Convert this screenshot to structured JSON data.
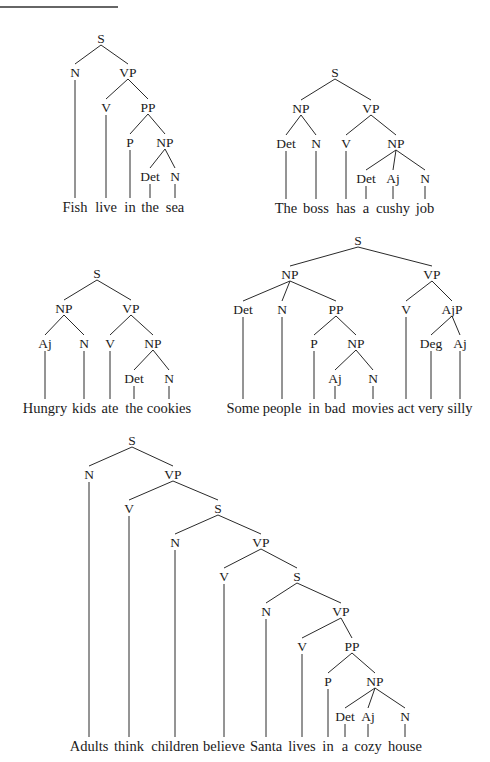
{
  "figure": {
    "top_rule": {
      "x1": 0,
      "x2": 118,
      "y": 7
    }
  },
  "trees": [
    {
      "id": "tree-fish",
      "sentence": "Fish live in the sea",
      "nodes": [
        {
          "id": "S",
          "label": "S",
          "x": 101,
          "y": 38
        },
        {
          "id": "N1",
          "label": "N",
          "x": 75,
          "y": 72,
          "parent": "S"
        },
        {
          "id": "VP",
          "label": "VP",
          "x": 128,
          "y": 72,
          "parent": "S"
        },
        {
          "id": "V",
          "label": "V",
          "x": 106,
          "y": 107,
          "parent": "VP"
        },
        {
          "id": "PP",
          "label": "PP",
          "x": 148,
          "y": 107,
          "parent": "VP"
        },
        {
          "id": "P",
          "label": "P",
          "x": 130,
          "y": 142,
          "parent": "PP"
        },
        {
          "id": "NP",
          "label": "NP",
          "x": 165,
          "y": 142,
          "parent": "PP"
        },
        {
          "id": "Det",
          "label": "Det",
          "x": 150,
          "y": 176,
          "parent": "NP"
        },
        {
          "id": "N2",
          "label": "N",
          "x": 175,
          "y": 176,
          "parent": "NP"
        }
      ],
      "words": [
        {
          "text": "Fish",
          "x": 75,
          "parent": "N1"
        },
        {
          "text": "live",
          "x": 106,
          "parent": "V"
        },
        {
          "text": "in",
          "x": 130,
          "parent": "P"
        },
        {
          "text": "the",
          "x": 150,
          "parent": "Det"
        },
        {
          "text": "sea",
          "x": 175,
          "parent": "N2"
        }
      ],
      "word_y": 212
    },
    {
      "id": "tree-boss",
      "sentence": "The boss has a cushy job",
      "nodes": [
        {
          "id": "S",
          "label": "S",
          "x": 335,
          "y": 72
        },
        {
          "id": "NP1",
          "label": "NP",
          "x": 301,
          "y": 108,
          "parent": "S"
        },
        {
          "id": "VP",
          "label": "VP",
          "x": 371,
          "y": 108,
          "parent": "S"
        },
        {
          "id": "Det1",
          "label": "Det",
          "x": 286,
          "y": 143,
          "parent": "NP1"
        },
        {
          "id": "N1",
          "label": "N",
          "x": 316,
          "y": 143,
          "parent": "NP1"
        },
        {
          "id": "V",
          "label": "V",
          "x": 346,
          "y": 143,
          "parent": "VP"
        },
        {
          "id": "NP2",
          "label": "NP",
          "x": 396,
          "y": 143,
          "parent": "VP"
        },
        {
          "id": "Det2",
          "label": "Det",
          "x": 366,
          "y": 178,
          "parent": "NP2"
        },
        {
          "id": "Aj",
          "label": "Aj",
          "x": 393,
          "y": 178,
          "parent": "NP2"
        },
        {
          "id": "N2",
          "label": "N",
          "x": 425,
          "y": 178,
          "parent": "NP2"
        }
      ],
      "words": [
        {
          "text": "The",
          "x": 286,
          "parent": "Det1"
        },
        {
          "text": "boss",
          "x": 316,
          "parent": "N1"
        },
        {
          "text": "has",
          "x": 346,
          "parent": "V"
        },
        {
          "text": "a",
          "x": 366,
          "parent": "Det2"
        },
        {
          "text": "cushy",
          "x": 393,
          "parent": "Aj"
        },
        {
          "text": "job",
          "x": 425,
          "parent": "N2"
        }
      ],
      "word_y": 213
    },
    {
      "id": "tree-hungry",
      "sentence": "Hungry kids ate the cookies",
      "nodes": [
        {
          "id": "S",
          "label": "S",
          "x": 97,
          "y": 273
        },
        {
          "id": "NP1",
          "label": "NP",
          "x": 64,
          "y": 308,
          "parent": "S"
        },
        {
          "id": "VP",
          "label": "VP",
          "x": 131,
          "y": 308,
          "parent": "S"
        },
        {
          "id": "Aj",
          "label": "Aj",
          "x": 45,
          "y": 343,
          "parent": "NP1"
        },
        {
          "id": "N1",
          "label": "N",
          "x": 84,
          "y": 343,
          "parent": "NP1"
        },
        {
          "id": "V",
          "label": "V",
          "x": 110,
          "y": 343,
          "parent": "VP"
        },
        {
          "id": "NP2",
          "label": "NP",
          "x": 153,
          "y": 343,
          "parent": "VP"
        },
        {
          "id": "Det",
          "label": "Det",
          "x": 134,
          "y": 378,
          "parent": "NP2"
        },
        {
          "id": "N2",
          "label": "N",
          "x": 169,
          "y": 378,
          "parent": "NP2"
        }
      ],
      "words": [
        {
          "text": "Hungry",
          "x": 45,
          "parent": "Aj"
        },
        {
          "text": "kids",
          "x": 84,
          "parent": "N1"
        },
        {
          "text": "ate",
          "x": 110,
          "parent": "V"
        },
        {
          "text": "the",
          "x": 134,
          "parent": "Det"
        },
        {
          "text": "cookies",
          "x": 169,
          "parent": "N2"
        }
      ],
      "word_y": 413
    },
    {
      "id": "tree-some-people",
      "sentence": "Some people in bad movies act very silly",
      "nodes": [
        {
          "id": "S",
          "label": "S",
          "x": 358,
          "y": 240
        },
        {
          "id": "NP1",
          "label": "NP",
          "x": 290,
          "y": 274,
          "parent": "S"
        },
        {
          "id": "VP",
          "label": "VP",
          "x": 432,
          "y": 274,
          "parent": "S"
        },
        {
          "id": "Det",
          "label": "Det",
          "x": 243,
          "y": 309,
          "parent": "NP1"
        },
        {
          "id": "N1",
          "label": "N",
          "x": 282,
          "y": 309,
          "parent": "NP1"
        },
        {
          "id": "PP",
          "label": "PP",
          "x": 336,
          "y": 309,
          "parent": "NP1"
        },
        {
          "id": "V",
          "label": "V",
          "x": 406,
          "y": 309,
          "parent": "VP"
        },
        {
          "id": "AjP",
          "label": "AjP",
          "x": 452,
          "y": 309,
          "parent": "VP"
        },
        {
          "id": "P",
          "label": "P",
          "x": 314,
          "y": 343,
          "parent": "PP"
        },
        {
          "id": "NP2",
          "label": "NP",
          "x": 356,
          "y": 343,
          "parent": "PP"
        },
        {
          "id": "Deg",
          "label": "Deg",
          "x": 431,
          "y": 343,
          "parent": "AjP"
        },
        {
          "id": "Aj1",
          "label": "Aj",
          "x": 460,
          "y": 343,
          "parent": "AjP"
        },
        {
          "id": "Aj2",
          "label": "Aj",
          "x": 335,
          "y": 378,
          "parent": "NP2"
        },
        {
          "id": "N2",
          "label": "N",
          "x": 373,
          "y": 378,
          "parent": "NP2"
        }
      ],
      "words": [
        {
          "text": "Some",
          "x": 243,
          "parent": "Det"
        },
        {
          "text": "people",
          "x": 282,
          "parent": "N1"
        },
        {
          "text": "in",
          "x": 314,
          "parent": "P"
        },
        {
          "text": "bad",
          "x": 335,
          "parent": "Aj2"
        },
        {
          "text": "movies",
          "x": 373,
          "parent": "N2"
        },
        {
          "text": "act",
          "x": 406,
          "parent": "V"
        },
        {
          "text": "very",
          "x": 431,
          "parent": "Deg"
        },
        {
          "text": "silly",
          "x": 460,
          "parent": "Aj1"
        }
      ],
      "word_y": 413
    },
    {
      "id": "tree-adults",
      "sentence": "Adults think children believe Santa lives in a cozy house",
      "nodes": [
        {
          "id": "S1",
          "label": "S",
          "x": 132,
          "y": 440
        },
        {
          "id": "N1",
          "label": "N",
          "x": 89,
          "y": 474,
          "parent": "S1"
        },
        {
          "id": "VP1",
          "label": "VP",
          "x": 173,
          "y": 474,
          "parent": "S1"
        },
        {
          "id": "V1",
          "label": "V",
          "x": 129,
          "y": 508,
          "parent": "VP1"
        },
        {
          "id": "S2",
          "label": "S",
          "x": 218,
          "y": 508,
          "parent": "VP1"
        },
        {
          "id": "N2",
          "label": "N",
          "x": 175,
          "y": 542,
          "parent": "S2"
        },
        {
          "id": "VP2",
          "label": "VP",
          "x": 261,
          "y": 542,
          "parent": "S2"
        },
        {
          "id": "V2",
          "label": "V",
          "x": 224,
          "y": 576,
          "parent": "VP2"
        },
        {
          "id": "S3",
          "label": "S",
          "x": 297,
          "y": 576,
          "parent": "VP2"
        },
        {
          "id": "N3",
          "label": "N",
          "x": 266,
          "y": 611,
          "parent": "S3"
        },
        {
          "id": "VP3",
          "label": "VP",
          "x": 341,
          "y": 611,
          "parent": "S3"
        },
        {
          "id": "V3",
          "label": "V",
          "x": 302,
          "y": 646,
          "parent": "VP3"
        },
        {
          "id": "PP",
          "label": "PP",
          "x": 352,
          "y": 646,
          "parent": "VP3"
        },
        {
          "id": "P",
          "label": "P",
          "x": 328,
          "y": 681,
          "parent": "PP"
        },
        {
          "id": "NP",
          "label": "NP",
          "x": 375,
          "y": 681,
          "parent": "PP"
        },
        {
          "id": "Det",
          "label": "Det",
          "x": 345,
          "y": 716,
          "parent": "NP"
        },
        {
          "id": "Aj",
          "label": "Aj",
          "x": 368,
          "y": 716,
          "parent": "NP"
        },
        {
          "id": "N4",
          "label": "N",
          "x": 405,
          "y": 716,
          "parent": "NP"
        }
      ],
      "words": [
        {
          "text": "Adults",
          "x": 89,
          "parent": "N1"
        },
        {
          "text": "think",
          "x": 129,
          "parent": "V1"
        },
        {
          "text": "children",
          "x": 175,
          "parent": "N2"
        },
        {
          "text": "believe",
          "x": 224,
          "parent": "V2"
        },
        {
          "text": "Santa",
          "x": 266,
          "parent": "N3"
        },
        {
          "text": "lives",
          "x": 302,
          "parent": "V3"
        },
        {
          "text": "in",
          "x": 328,
          "parent": "P"
        },
        {
          "text": "a",
          "x": 345,
          "parent": "Det"
        },
        {
          "text": "cozy",
          "x": 368,
          "parent": "Aj"
        },
        {
          "text": "house",
          "x": 405,
          "parent": "N4"
        }
      ],
      "word_y": 751
    }
  ]
}
